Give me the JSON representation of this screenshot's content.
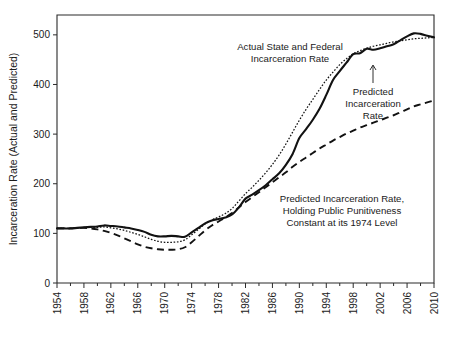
{
  "chart_data": {
    "type": "line",
    "title": "",
    "xlabel": "",
    "ylabel": "Incarceration Rate (Actual and Predicted)",
    "xlim": [
      1954,
      2010
    ],
    "ylim": [
      0,
      540
    ],
    "yticks": [
      0,
      100,
      200,
      300,
      400,
      500
    ],
    "ytick_labels": [
      "0",
      "100",
      "200",
      "300",
      "400",
      "500"
    ],
    "xticks": [
      1954,
      1958,
      1962,
      1966,
      1970,
      1974,
      1978,
      1982,
      1986,
      1990,
      1994,
      1998,
      2002,
      2006,
      2010
    ],
    "xtick_labels": [
      "1954",
      "1958",
      "1962",
      "1966",
      "1970",
      "1974",
      "1978",
      "1982",
      "1986",
      "1990",
      "1994",
      "1998",
      "2002",
      "2006",
      "2010"
    ],
    "x_minor_tick_interval": 2,
    "grid": false,
    "legend_position": "inline-annotations",
    "line_color": "#121212",
    "background": "#ffffff",
    "x": [
      1954,
      1955,
      1956,
      1957,
      1958,
      1959,
      1960,
      1961,
      1962,
      1963,
      1964,
      1965,
      1966,
      1967,
      1968,
      1969,
      1970,
      1971,
      1972,
      1973,
      1974,
      1975,
      1976,
      1977,
      1978,
      1979,
      1980,
      1981,
      1982,
      1983,
      1984,
      1985,
      1986,
      1987,
      1988,
      1989,
      1990,
      1991,
      1992,
      1993,
      1994,
      1995,
      1996,
      1997,
      1998,
      1999,
      2000,
      2001,
      2002,
      2003,
      2004,
      2005,
      2006,
      2007,
      2008,
      2009,
      2010
    ],
    "series": [
      {
        "name": "Actual State and Federal Incarceration Rate",
        "style": "solid",
        "values": [
          110,
          110,
          110,
          111,
          112,
          113,
          114,
          116,
          115,
          114,
          112,
          110,
          107,
          103,
          97,
          94,
          94,
          95,
          94,
          93,
          102,
          111,
          120,
          126,
          129,
          132,
          138,
          152,
          170,
          178,
          187,
          197,
          209,
          221,
          238,
          260,
          292,
          310,
          329,
          351,
          379,
          409,
          427,
          444,
          461,
          463,
          472,
          470,
          473,
          477,
          481,
          489,
          497,
          503,
          502,
          498,
          495
        ]
      },
      {
        "name": "Predicted Incarceration Rate",
        "style": "dotted",
        "values": [
          110,
          110,
          110,
          111,
          112,
          112,
          112,
          113,
          111,
          109,
          106,
          102,
          98,
          93,
          88,
          84,
          82,
          82,
          83,
          87,
          97,
          108,
          119,
          127,
          133,
          140,
          150,
          165,
          180,
          193,
          207,
          222,
          239,
          258,
          280,
          304,
          328,
          350,
          370,
          390,
          409,
          425,
          440,
          452,
          462,
          468,
          473,
          477,
          480,
          483,
          486,
          488,
          490,
          492,
          493,
          494,
          495
        ]
      },
      {
        "name": "Predicted Incarceration Rate, Holding Public Punitiveness Constant at its 1974 Level",
        "style": "dashed",
        "values": [
          110,
          110,
          110,
          111,
          111,
          110,
          108,
          105,
          101,
          96,
          90,
          84,
          78,
          73,
          70,
          68,
          67,
          67,
          68,
          72,
          82,
          94,
          106,
          116,
          124,
          132,
          141,
          152,
          163,
          173,
          183,
          193,
          203,
          213,
          223,
          234,
          244,
          253,
          262,
          271,
          279,
          287,
          294,
          301,
          307,
          313,
          318,
          323,
          328,
          333,
          338,
          344,
          350,
          356,
          360,
          364,
          368
        ]
      }
    ],
    "annotations": [
      {
        "id": "actual-label",
        "text_lines": [
          "Actual State and Federal",
          "Incarceration Rate"
        ],
        "anchor_x": 1987.5,
        "anchor_y": 497
      },
      {
        "id": "predicted-label",
        "text_lines": [
          "Predicted",
          "Incarceration",
          "Rate"
        ],
        "anchor_x": 2001.5,
        "anchor_y": 415,
        "arrow": true
      },
      {
        "id": "counterfactual-label",
        "text_lines": [
          "Predicted Incarceration Rate,",
          "Holding Public Punitiveness",
          "Constant at its 1974 Level"
        ],
        "anchor_x": 1996.5,
        "anchor_y": 222
      }
    ]
  },
  "axis": {
    "y_title": "Incarceration Rate (Actual and Predicted)",
    "y_labels": [
      "500",
      "400",
      "300",
      "200",
      "100",
      "0"
    ],
    "x_labels": [
      "1954",
      "1958",
      "1962",
      "1966",
      "1970",
      "1974",
      "1978",
      "1982",
      "1986",
      "1990",
      "1994",
      "1998",
      "2002",
      "2006",
      "2010"
    ]
  },
  "annotations": {
    "actual_line1": "Actual State and Federal",
    "actual_line2": "Incarceration Rate",
    "predicted_line1": "Predicted",
    "predicted_line2": "Incarceration",
    "predicted_line3": "Rate",
    "counterfactual_line1": "Predicted Incarceration Rate,",
    "counterfactual_line2": "Holding Public Punitiveness",
    "counterfactual_line3": "Constant at its 1974 Level"
  }
}
